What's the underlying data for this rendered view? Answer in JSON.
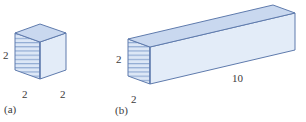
{
  "figure": {
    "background_color": "#ffffff",
    "stroke_color": "#5f7bad",
    "top_face_color": "#c9d8ef",
    "right_face_color": "#e3ecf8",
    "front_face_color": "#dce7f6",
    "hatch_color": "#8ba6d0",
    "text_color": "#3b3b3b"
  },
  "panels": [
    {
      "id": "a",
      "caption": "(a)",
      "shape": "cube",
      "labels": {
        "height": "2",
        "width": "2",
        "depth": "2"
      }
    },
    {
      "id": "b",
      "caption": "(b)",
      "shape": "rectangular-prism",
      "labels": {
        "height": "2",
        "width": "2",
        "length": "10"
      }
    }
  ]
}
